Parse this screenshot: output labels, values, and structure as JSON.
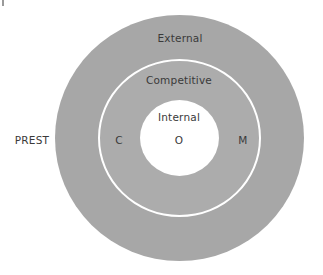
{
  "diagram": {
    "type": "concentric-circles",
    "rings": [
      {
        "name": "outer",
        "label": "External",
        "color": "#a7a7a7"
      },
      {
        "name": "middle",
        "label": "Competitive",
        "color": "#acacac"
      },
      {
        "name": "inner",
        "label": "Internal",
        "color": "#ffffff"
      }
    ],
    "side_label": "PREST",
    "letters": {
      "left": "C",
      "center": "O",
      "right": "M"
    }
  }
}
